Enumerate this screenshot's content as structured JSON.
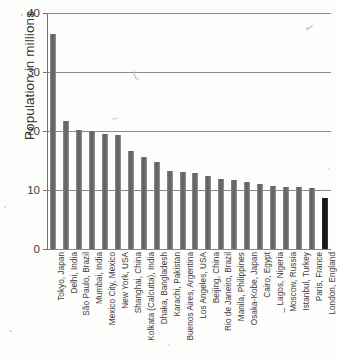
{
  "chart_data": {
    "type": "bar",
    "title": "",
    "xlabel": "",
    "ylabel": "Population in millions",
    "ylim": [
      0,
      40
    ],
    "yticks": [
      0,
      10,
      20,
      30,
      40
    ],
    "ytick_labels": [
      "0",
      "10",
      "20",
      "30",
      "40"
    ],
    "grid": true,
    "legend": "none",
    "bar_color": "#6b6b6b",
    "highlight_color": "#141414",
    "highlight_category": "London, England",
    "categories": [
      "Tokyo, Japan",
      "Delhi, India",
      "São Paulo, Brazil",
      "Mumbai, India",
      "Mexico City, Mexico",
      "New York, USA",
      "Shanghai, China",
      "Kolkata (Calcutta), India",
      "Dhaka, Bangladesh",
      "Karachi, Pakistan",
      "Buenos Aires, Argentina",
      "Los Angeles, USA",
      "Beijing, China",
      "Rio de Janeiro, Brazil",
      "Manila, Philippines",
      "Osaka-Kobe, Japan",
      "Cairo, Egypt",
      "_ Lagos, Nigeria",
      "Moscow, Russia",
      "Istanbul, Turkey",
      "Paris, France",
      "London, England"
    ],
    "values": [
      36.5,
      21.7,
      20.2,
      20.0,
      19.5,
      19.4,
      16.6,
      15.6,
      14.8,
      13.2,
      13.1,
      12.8,
      12.4,
      11.9,
      11.7,
      11.3,
      11.0,
      10.6,
      10.5,
      10.5,
      10.4,
      8.6
    ]
  },
  "artifacts": {
    "top_right_mark": "✓",
    "mid_left_mark": "(",
    "bar_mark": "✓"
  }
}
